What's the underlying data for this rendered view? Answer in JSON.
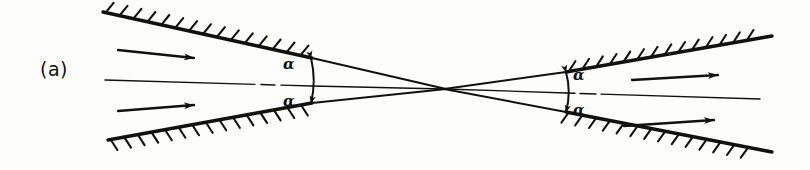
{
  "figure": {
    "panel_label": "(a)",
    "ink_color": "#111111",
    "background_color": "#fdfdfb"
  },
  "labels": {
    "alpha_top_left": "α",
    "alpha_bottom_left": "α",
    "alpha_top_right": "α",
    "alpha_bottom_right": "α"
  },
  "geometry": {
    "crossing_point": {
      "x": 445,
      "y": 89
    },
    "walls": [
      {
        "name": "wall-top-left",
        "x1": 103,
        "y1": 12,
        "x2": 312,
        "y2": 58,
        "hatch_side": "above"
      },
      {
        "name": "wall-bottom-left",
        "x1": 108,
        "y1": 140,
        "x2": 312,
        "y2": 103,
        "hatch_side": "below"
      },
      {
        "name": "wall-top-right",
        "x1": 566,
        "y1": 72,
        "x2": 772,
        "y2": 36,
        "hatch_side": "above"
      },
      {
        "name": "wall-bottom-right",
        "x1": 566,
        "y1": 112,
        "x2": 772,
        "y2": 152,
        "hatch_side": "below"
      }
    ],
    "rays": [
      {
        "name": "ray-upper-left",
        "x1": 312,
        "y1": 58,
        "x2": 445,
        "y2": 89
      },
      {
        "name": "ray-lower-left",
        "x1": 312,
        "y1": 103,
        "x2": 445,
        "y2": 89
      },
      {
        "name": "ray-upper-right",
        "x1": 445,
        "y1": 89,
        "x2": 566,
        "y2": 72
      },
      {
        "name": "ray-lower-right",
        "x1": 445,
        "y1": 89,
        "x2": 566,
        "y2": 112
      }
    ],
    "angle_markers": [
      {
        "name": "angle-marker-left",
        "x": 312,
        "y_top": 58,
        "y_bottom": 103
      },
      {
        "name": "angle-marker-right",
        "x": 566,
        "y_top": 72,
        "y_bottom": 112
      }
    ],
    "flow_arrows": [
      {
        "name": "flow-arrow-inlet-upper",
        "x1": 118,
        "y1": 50,
        "x2": 194,
        "y2": 58,
        "direction": "right"
      },
      {
        "name": "flow-arrow-inlet-lower",
        "x1": 118,
        "y1": 111,
        "x2": 194,
        "y2": 105,
        "direction": "right"
      },
      {
        "name": "flow-arrow-outlet-upper",
        "x1": 632,
        "y1": 80,
        "x2": 718,
        "y2": 75,
        "direction": "right"
      },
      {
        "name": "flow-arrow-outlet-lower",
        "x1": 624,
        "y1": 126,
        "x2": 714,
        "y2": 120,
        "direction": "right"
      }
    ],
    "centerlines": [
      {
        "name": "centerline-left",
        "x1": 105,
        "y1": 80,
        "x2": 312,
        "y2": 86
      },
      {
        "name": "centerline-right",
        "x1": 566,
        "y1": 93,
        "x2": 760,
        "y2": 99
      }
    ],
    "through_lines": [
      {
        "name": "through-line-left",
        "x1": 312,
        "y1": 86,
        "x2": 445,
        "y2": 89
      },
      {
        "name": "through-line-right",
        "x1": 445,
        "y1": 89,
        "x2": 566,
        "y2": 93
      }
    ]
  }
}
